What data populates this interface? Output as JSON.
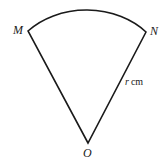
{
  "figure": {
    "type": "circular-sector",
    "background_color": "#ffffff",
    "stroke_color": "#1a1a1a",
    "stroke_width": 1.6,
    "labels": {
      "vertex_m": "M",
      "vertex_n": "N",
      "vertex_o": "O",
      "radius_symbol": "r",
      "radius_unit": "cm"
    },
    "geometry": {
      "apex": {
        "x": 88,
        "y": 143
      },
      "arc_start": {
        "x": 28,
        "y": 31
      },
      "arc_end": {
        "x": 146,
        "y": 32
      },
      "arc_peak": {
        "x": 86,
        "y": 12
      },
      "arc_radius_x": 78,
      "arc_radius_y": 62
    }
  }
}
